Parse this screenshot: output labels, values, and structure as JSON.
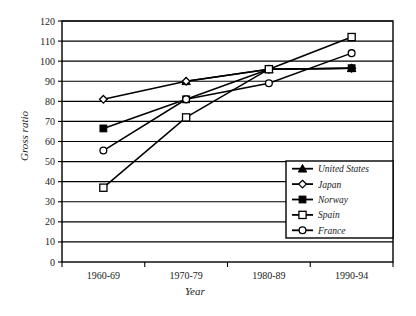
{
  "chart_data": {
    "type": "line",
    "title": "",
    "xlabel": "Year",
    "ylabel": "Gross ratio",
    "categories": [
      "1960-69",
      "1970-79",
      "1980-89",
      "1990-94"
    ],
    "ylim": [
      0,
      120
    ],
    "ytick_step": 10,
    "yticks": [
      0,
      10,
      20,
      30,
      40,
      50,
      60,
      70,
      80,
      90,
      100,
      110,
      120
    ],
    "grid": "horizontal",
    "legend_position": "inside-bottom-right",
    "series": [
      {
        "name": "United States",
        "marker": "filled-triangle",
        "values": [
          null,
          90,
          96,
          96.5
        ]
      },
      {
        "name": "Japan",
        "marker": "open-diamond",
        "values": [
          81,
          90,
          96,
          96.5
        ]
      },
      {
        "name": "Norway",
        "marker": "filled-square",
        "values": [
          66.5,
          81,
          96,
          96.5
        ]
      },
      {
        "name": "Spain",
        "marker": "open-square",
        "values": [
          37,
          72,
          96,
          112
        ]
      },
      {
        "name": "France",
        "marker": "open-circle",
        "values": [
          55.5,
          81,
          89,
          104
        ]
      }
    ]
  },
  "legend": {
    "entries": [
      {
        "label": "United States"
      },
      {
        "label": "Japan"
      },
      {
        "label": "Norway"
      },
      {
        "label": "Spain"
      },
      {
        "label": "France"
      }
    ]
  },
  "colors": {
    "line": "#000000",
    "grid": "#000000",
    "axis": "#000000",
    "background": "#ffffff",
    "marker_fill_open": "#ffffff"
  }
}
